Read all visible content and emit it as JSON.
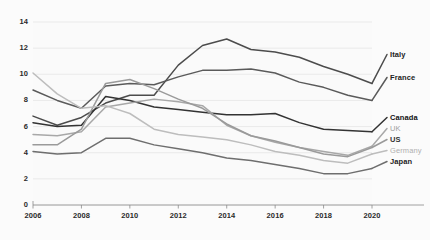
{
  "chart_data": {
    "type": "line",
    "title": "",
    "subtitle": "",
    "xlabel": "",
    "ylabel": "",
    "xlim": [
      2006,
      2020
    ],
    "ylim": [
      0,
      14
    ],
    "grid": true,
    "legend_position": "right-inline",
    "x": [
      2006,
      2007,
      2008,
      2009,
      2010,
      2011,
      2012,
      2013,
      2014,
      2015,
      2016,
      2017,
      2018,
      2019,
      2020
    ],
    "xticks": [
      "2006",
      "2008",
      "2010",
      "2012",
      "2014",
      "2016",
      "2018",
      "2020"
    ],
    "xtick_values": [
      2006,
      2008,
      2010,
      2012,
      2014,
      2016,
      2018,
      2020
    ],
    "yticks": [
      "0",
      "2",
      "4",
      "6",
      "8",
      "10",
      "12",
      "14"
    ],
    "ytick_values": [
      0,
      2,
      4,
      6,
      8,
      10,
      12,
      14
    ],
    "series": [
      {
        "name": "Italy",
        "color": "#4c4c4c",
        "width": 1.5,
        "label_color": "#222222",
        "label_weight": "bold",
        "values": [
          6.8,
          6.1,
          6.7,
          7.8,
          8.4,
          8.4,
          10.7,
          12.2,
          12.7,
          11.9,
          11.7,
          11.3,
          10.6,
          10.0,
          9.3
        ]
      },
      {
        "name": "France",
        "color": "#5a5a5a",
        "width": 1.5,
        "label_color": "#222222",
        "label_weight": "bold",
        "values": [
          8.8,
          8.0,
          7.4,
          9.1,
          9.3,
          9.2,
          9.8,
          10.3,
          10.3,
          10.4,
          10.1,
          9.4,
          9.0,
          8.4,
          8.0
        ]
      },
      {
        "name": "Canada",
        "color": "#333333",
        "width": 1.5,
        "label_color": "#111111",
        "label_weight": "bold",
        "values": [
          6.3,
          6.0,
          6.1,
          8.3,
          8.0,
          7.5,
          7.3,
          7.1,
          6.9,
          6.9,
          7.0,
          6.3,
          5.8,
          5.7,
          5.6
        ]
      },
      {
        "name": "UK",
        "color": "#a8a8a8",
        "width": 1.5,
        "label_color": "#a0a0a0",
        "label_weight": "normal",
        "values": [
          5.4,
          5.3,
          5.6,
          7.5,
          7.8,
          8.1,
          7.9,
          7.6,
          6.1,
          5.3,
          4.8,
          4.4,
          4.1,
          3.8,
          4.5
        ]
      },
      {
        "name": "US",
        "color": "#9a9a9a",
        "width": 1.5,
        "label_color": "#333333",
        "label_weight": "bold",
        "values": [
          4.6,
          4.6,
          5.8,
          9.3,
          9.6,
          8.9,
          8.1,
          7.4,
          6.2,
          5.3,
          4.9,
          4.4,
          3.9,
          3.7,
          4.4
        ]
      },
      {
        "name": "Germany",
        "color": "#bdbdbd",
        "width": 1.5,
        "label_color": "#b0b0b0",
        "label_weight": "normal",
        "values": [
          10.1,
          8.5,
          7.4,
          7.6,
          7.0,
          5.8,
          5.4,
          5.2,
          5.0,
          4.6,
          4.1,
          3.8,
          3.4,
          3.2,
          3.9
        ]
      },
      {
        "name": "Japan",
        "color": "#6e6e6e",
        "width": 1.5,
        "label_color": "#222222",
        "label_weight": "bold",
        "values": [
          4.1,
          3.9,
          4.0,
          5.1,
          5.1,
          4.6,
          4.3,
          4.0,
          3.6,
          3.4,
          3.1,
          2.8,
          2.4,
          2.4,
          2.8
        ]
      }
    ],
    "label_positions": [
      {
        "name": "Italy",
        "x": 390,
        "y": 57
      },
      {
        "name": "France",
        "x": 390,
        "y": 80
      },
      {
        "name": "Canada",
        "x": 390,
        "y": 120
      },
      {
        "name": "UK",
        "x": 390,
        "y": 131
      },
      {
        "name": "US",
        "x": 390,
        "y": 142
      },
      {
        "name": "Germany",
        "x": 390,
        "y": 153
      },
      {
        "name": "Japan",
        "x": 390,
        "y": 164
      }
    ]
  },
  "style": {
    "background": "#fbfbfb",
    "plot_background": "#fafafa",
    "grid_color": "#e2e2e2",
    "axis_color": "#8a8a8a",
    "tick_text_color": "#2a2a2a"
  }
}
